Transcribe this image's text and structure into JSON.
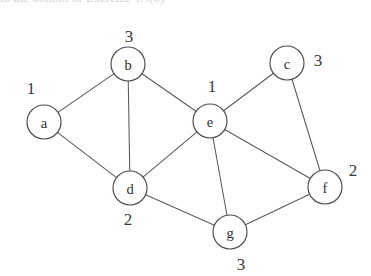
{
  "figure": {
    "kind": "undirected-graph-diagram",
    "background_color": "#ffffff",
    "stroke_color": "#59595e",
    "node_fill_color": "#ffffff",
    "node_stroke_color": "#4a4a50",
    "text_color": "#2e2e33",
    "clipped_caption_text": "to the bottom of Exercise 4.4(b)"
  },
  "chart_data": {
    "type": "diagram",
    "title": "",
    "nodes": [
      {
        "id": "a",
        "label": "a",
        "weight": "1",
        "cx": 44,
        "cy": 122,
        "r": 17,
        "weight_x": 31,
        "weight_y": 88
      },
      {
        "id": "b",
        "label": "b",
        "weight": "3",
        "cx": 128,
        "cy": 64,
        "r": 17,
        "weight_x": 129,
        "weight_y": 36
      },
      {
        "id": "c",
        "label": "c",
        "weight": "3",
        "cx": 287,
        "cy": 63,
        "r": 17,
        "weight_x": 318,
        "weight_y": 60
      },
      {
        "id": "d",
        "label": "d",
        "weight": "2",
        "cx": 130,
        "cy": 188,
        "r": 17,
        "weight_x": 128,
        "weight_y": 219
      },
      {
        "id": "e",
        "label": "e",
        "weight": "1",
        "cx": 210,
        "cy": 121,
        "r": 17,
        "weight_x": 212,
        "weight_y": 86
      },
      {
        "id": "f",
        "label": "f",
        "weight": "2",
        "cx": 325,
        "cy": 187,
        "r": 17,
        "weight_x": 353,
        "weight_y": 170
      },
      {
        "id": "g",
        "label": "g",
        "weight": "3",
        "cx": 230,
        "cy": 232,
        "r": 17,
        "weight_x": 241,
        "weight_y": 264
      }
    ],
    "edges": [
      {
        "source": "a",
        "target": "b"
      },
      {
        "source": "a",
        "target": "d"
      },
      {
        "source": "b",
        "target": "d"
      },
      {
        "source": "b",
        "target": "e"
      },
      {
        "source": "d",
        "target": "e"
      },
      {
        "source": "d",
        "target": "g"
      },
      {
        "source": "e",
        "target": "c"
      },
      {
        "source": "e",
        "target": "g"
      },
      {
        "source": "e",
        "target": "f"
      },
      {
        "source": "c",
        "target": "f"
      },
      {
        "source": "g",
        "target": "f"
      }
    ]
  }
}
